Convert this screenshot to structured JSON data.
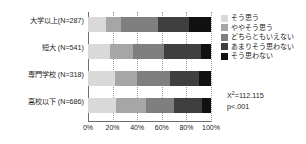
{
  "chart_data": {
    "type": "bar",
    "orientation": "horizontal",
    "stacked": true,
    "normalized_percent": true,
    "title": "",
    "xlabel": "",
    "ylabel": "",
    "xlim": [
      0,
      100
    ],
    "grid": true,
    "legend_position": "right",
    "categories": [
      "大学以上(N=287)",
      "短大 (N=541)",
      "専門学校 (N=318)",
      "高校以下 (N=686)"
    ],
    "xtick_labels": [
      "0%",
      "20%",
      "40%",
      "60%",
      "80%",
      "100%"
    ],
    "xtick_values": [
      0,
      20,
      40,
      60,
      80,
      100
    ],
    "series": [
      {
        "name": "そう思う",
        "color": "#d9d9d9",
        "values": [
          15,
          18,
          22,
          23
        ]
      },
      {
        "name": "ややそう思う",
        "color": "#a6a6a6",
        "values": [
          12,
          19,
          18,
          24
        ]
      },
      {
        "name": "どちらともいえない",
        "color": "#7f7f7f",
        "values": [
          30,
          25,
          27,
          23
        ]
      },
      {
        "name": "あまりそう思わない",
        "color": "#3f3f3f",
        "values": [
          25,
          30,
          23,
          23
        ]
      },
      {
        "name": "そう思わない",
        "color": "#111111",
        "values": [
          18,
          8,
          10,
          7
        ]
      }
    ],
    "annotations": {
      "chi_square_prefix": "X",
      "chi_square_sup": "2",
      "chi_square_value": "=112.115",
      "p_value": "p<.001"
    }
  }
}
